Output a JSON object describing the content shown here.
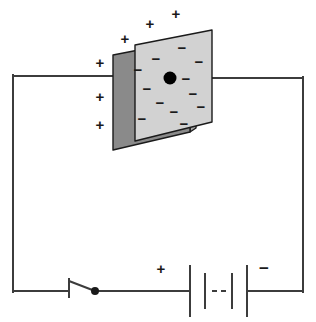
{
  "figure": {
    "type": "circuit-diagram",
    "canvas": {
      "width": 316,
      "height": 322,
      "background": "#ffffff"
    }
  },
  "colors": {
    "wire": "#3c3c3c",
    "ink": "#1a1a1a",
    "front_plate_fill": "#d2d2d2",
    "back_plate_fill": "#8a8a8a",
    "plate_edge_fill": "#a8a8a8",
    "plate_stroke": "#1a1a1a",
    "dot": "#000000"
  },
  "circuit": {
    "loop": {
      "left_x": 13,
      "right_x": 303,
      "top_y": 76,
      "bottom_y": 291,
      "stroke_width": 2
    },
    "top_wire_left_label": "wire-from-left-to-negative-plate",
    "top_wire_right_label": "wire-from-positive-plate-to-right"
  },
  "capacitor": {
    "name": "parallel-plate-capacitor",
    "front_plate": {
      "label": "negative-plate",
      "charge_sign": "−",
      "fill": "#d2d2d2",
      "points": "135,45 212,30 212,122 135,141",
      "minus_count": 12,
      "minus_signs": [
        {
          "x": 182,
          "y": 49
        },
        {
          "x": 156,
          "y": 60
        },
        {
          "x": 199,
          "y": 63
        },
        {
          "x": 138,
          "y": 71
        },
        {
          "x": 186,
          "y": 80
        },
        {
          "x": 147,
          "y": 90
        },
        {
          "x": 193,
          "y": 95
        },
        {
          "x": 160,
          "y": 104
        },
        {
          "x": 201,
          "y": 108
        },
        {
          "x": 174,
          "y": 113
        },
        {
          "x": 142,
          "y": 120
        },
        {
          "x": 184,
          "y": 125
        }
      ]
    },
    "back_plate": {
      "label": "positive-plate",
      "charge_sign": "+",
      "face_fill": "#8a8a8a",
      "face_points": "113,55 190,40 190,132 113,150",
      "edge_fill": "#a8a8a8",
      "edge_points": "190,40 196,36 196,128 190,132"
    },
    "junction_dot": {
      "x": 170,
      "y": 78,
      "r": 6.5,
      "label": "wire-junction-dot"
    },
    "plus_signs": [
      {
        "x": 176,
        "y": 15
      },
      {
        "x": 150,
        "y": 25
      },
      {
        "x": 125,
        "y": 40
      },
      {
        "x": 100,
        "y": 64
      },
      {
        "x": 100,
        "y": 98
      },
      {
        "x": 100,
        "y": 126
      }
    ],
    "plus_symbol": "+",
    "minus_symbol": "−"
  },
  "switch": {
    "name": "circuit-switch",
    "state": "open",
    "terminal_x": 69,
    "terminal_tick_top_y": 279,
    "terminal_tick_bottom_y": 297,
    "lever_from": {
      "x": 69,
      "y": 281
    },
    "lever_to": {
      "x": 95,
      "y": 291
    },
    "pivot_dot": {
      "x": 95,
      "y": 291,
      "r": 4
    }
  },
  "battery": {
    "name": "battery",
    "positive_label": "+",
    "negative_label": "−",
    "positive_label_pos": {
      "x": 161,
      "y": 270
    },
    "negative_label_pos": {
      "x": 264,
      "y": 270
    },
    "plates": [
      {
        "x": 190,
        "y1": 266,
        "y2": 316,
        "type": "long"
      },
      {
        "x": 205,
        "y1": 274,
        "y2": 308,
        "type": "short"
      },
      {
        "x": 232,
        "y1": 274,
        "y2": 308,
        "type": "short"
      },
      {
        "x": 247,
        "y1": 266,
        "y2": 316,
        "type": "long"
      }
    ],
    "dashes": [
      {
        "x1": 212,
        "x2": 217,
        "y": 291
      },
      {
        "x1": 221,
        "x2": 226,
        "y": 291
      }
    ],
    "wire_gap_left_end": 190,
    "wire_gap_right_start": 247
  }
}
